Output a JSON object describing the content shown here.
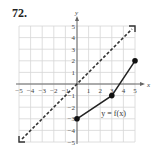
{
  "problem": {
    "number": "72."
  },
  "chart_data": {
    "type": "line",
    "title": "",
    "xlabel": "x",
    "ylabel": "y",
    "xlim": [
      -5,
      5
    ],
    "ylim": [
      -5,
      5
    ],
    "grid": true,
    "x_ticks": [
      "-5",
      "-4",
      "-3",
      "-2",
      "-1",
      "1",
      "2",
      "3",
      "4",
      "5"
    ],
    "y_ticks": [
      "5",
      "4",
      "3",
      "2",
      "1",
      "-1",
      "-2",
      "-3",
      "-4",
      "-5"
    ],
    "series": [
      {
        "name": "y = f(x)",
        "style": "solid",
        "points": [
          [
            0,
            -3
          ],
          [
            3,
            -1
          ],
          [
            5,
            2
          ]
        ],
        "endpoints": "closed-dots"
      },
      {
        "name": "y = x",
        "style": "dashed",
        "points": [
          [
            -5,
            -5
          ],
          [
            5,
            5
          ]
        ],
        "arrows": "both"
      }
    ],
    "annotations": [
      {
        "text": "y = f(x)",
        "x": 2.1,
        "y": -2.8
      }
    ]
  }
}
